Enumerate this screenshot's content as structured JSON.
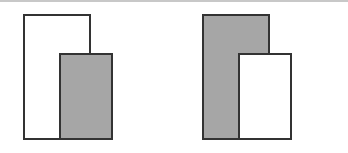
{
  "diagram": {
    "colors": {
      "fill_gray": "#a6a6a6",
      "fill_white": "#ffffff",
      "stroke": "#333333",
      "top_rule": "#c8c8c8"
    },
    "panels": [
      {
        "name": "left",
        "rects": [
          {
            "role": "back",
            "fill": "white",
            "x": 23,
            "y": 14,
            "w": 68,
            "h": 126
          },
          {
            "role": "front",
            "fill": "gray",
            "x": 59,
            "y": 53,
            "w": 54,
            "h": 87
          }
        ]
      },
      {
        "name": "right",
        "rects": [
          {
            "role": "back",
            "fill": "gray",
            "x": 202,
            "y": 14,
            "w": 68,
            "h": 126
          },
          {
            "role": "front",
            "fill": "white",
            "x": 238,
            "y": 53,
            "w": 54,
            "h": 87
          }
        ]
      }
    ]
  }
}
